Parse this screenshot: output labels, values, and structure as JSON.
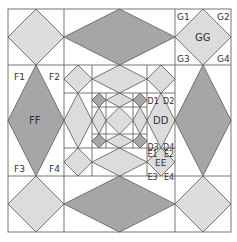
{
  "diagram": {
    "colors": {
      "background": "#ffffff",
      "line": "#666666",
      "light_fill": "#dcdcdc",
      "dark_fill": "#a6a6a6",
      "text": "#333333"
    },
    "labels": {
      "FF": "FF",
      "F1": "F1",
      "F2": "F2",
      "F3": "F3",
      "F4": "F4",
      "GG": "GG",
      "G1": "G1",
      "G2": "G2",
      "G3": "G3",
      "G4": "G4",
      "DD": "DD",
      "D1": "D1",
      "D2": "D2",
      "D3": "D3",
      "D4": "D4",
      "EE": "EE",
      "E1": "E1",
      "E2": "E2",
      "E3": "E3",
      "E4": "E4"
    }
  }
}
